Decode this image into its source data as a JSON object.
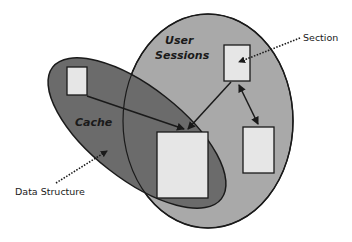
{
  "diagram": {
    "colors": {
      "background": "#ffffff",
      "user_sessions_fill": "#a9a9a9",
      "cache_fill": "#6b6b6b",
      "box_fill": "#e6e6e6",
      "stroke": "#1a1a1a",
      "text": "#1a1a1a"
    },
    "regions": {
      "user_sessions": {
        "label_line1": "User",
        "label_line2": "Sessions"
      },
      "cache": {
        "label": "Cache"
      }
    },
    "callouts": {
      "section": {
        "label": "Section"
      },
      "data_structure": {
        "label": "Data Structure"
      }
    },
    "boxes": [
      {
        "id": "cache-only-box"
      },
      {
        "id": "section-box"
      },
      {
        "id": "shared-box"
      },
      {
        "id": "session-only-box"
      }
    ],
    "edges": [
      {
        "from": "cache-only-box",
        "to": "shared-box",
        "style": "arrow"
      },
      {
        "from": "section-box",
        "to": "shared-box",
        "style": "arrow"
      },
      {
        "from": "section-box",
        "to": "session-only-box",
        "style": "double-arrow"
      }
    ]
  }
}
